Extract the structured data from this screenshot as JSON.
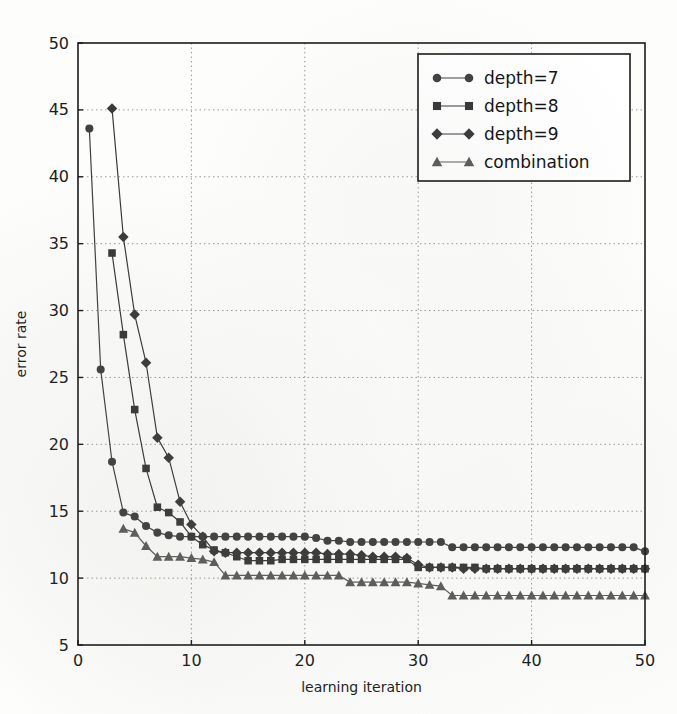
{
  "chart_data": {
    "type": "line",
    "title": "",
    "xlabel": "learning iteration",
    "ylabel": "error rate",
    "xlim": [
      0,
      50
    ],
    "ylim": [
      5,
      50
    ],
    "xticks": [
      0,
      10,
      20,
      30,
      40,
      50
    ],
    "yticks": [
      5,
      10,
      15,
      20,
      25,
      30,
      35,
      40,
      45,
      50
    ],
    "grid": true,
    "legend_position": "upper right",
    "series": [
      {
        "name": "depth=7",
        "marker": "circle",
        "color": "#404040",
        "x": [
          1,
          2,
          3,
          4,
          5,
          6,
          7,
          8,
          9,
          10,
          11,
          12,
          13,
          14,
          15,
          16,
          17,
          18,
          19,
          20,
          21,
          22,
          23,
          24,
          25,
          26,
          27,
          28,
          29,
          30,
          31,
          32,
          33,
          34,
          35,
          36,
          37,
          38,
          39,
          40,
          41,
          42,
          43,
          44,
          45,
          46,
          47,
          48,
          49,
          50
        ],
        "y": [
          43.6,
          25.6,
          18.7,
          14.9,
          14.6,
          13.9,
          13.4,
          13.2,
          13.1,
          13.1,
          13.1,
          13.1,
          13.1,
          13.1,
          13.1,
          13.1,
          13.1,
          13.1,
          13.1,
          13.1,
          13.0,
          12.8,
          12.8,
          12.7,
          12.7,
          12.7,
          12.7,
          12.7,
          12.7,
          12.7,
          12.7,
          12.7,
          12.3,
          12.3,
          12.3,
          12.3,
          12.3,
          12.3,
          12.3,
          12.3,
          12.3,
          12.3,
          12.3,
          12.3,
          12.3,
          12.3,
          12.3,
          12.3,
          12.3,
          12.0
        ]
      },
      {
        "name": "depth=8",
        "marker": "square",
        "color": "#383838",
        "x": [
          3,
          4,
          5,
          6,
          7,
          8,
          9,
          10,
          11,
          12,
          13,
          14,
          15,
          16,
          17,
          18,
          19,
          20,
          21,
          22,
          23,
          24,
          25,
          26,
          27,
          28,
          29,
          30,
          31,
          32,
          33,
          34,
          35,
          36,
          37,
          38,
          39,
          40,
          41,
          42,
          43,
          44,
          45,
          46,
          47,
          48,
          49,
          50
        ],
        "y": [
          34.3,
          28.2,
          22.6,
          18.2,
          15.3,
          14.9,
          14.2,
          13.1,
          12.5,
          12.1,
          11.9,
          11.6,
          11.3,
          11.3,
          11.3,
          11.4,
          11.4,
          11.4,
          11.4,
          11.4,
          11.4,
          11.4,
          11.4,
          11.4,
          11.4,
          11.4,
          11.4,
          10.8,
          10.8,
          10.8,
          10.8,
          10.8,
          10.8,
          10.7,
          10.7,
          10.7,
          10.7,
          10.7,
          10.7,
          10.7,
          10.7,
          10.7,
          10.7,
          10.7,
          10.7,
          10.7,
          10.7,
          10.7
        ]
      },
      {
        "name": "depth=9",
        "marker": "diamond",
        "color": "#3a3a3a",
        "x": [
          3,
          4,
          5,
          6,
          7,
          8,
          9,
          10,
          11,
          12,
          13,
          14,
          15,
          16,
          17,
          18,
          19,
          20,
          21,
          22,
          23,
          24,
          25,
          26,
          27,
          28,
          29,
          30,
          31,
          32,
          33,
          34,
          35,
          36,
          37,
          38,
          39,
          40,
          41,
          42,
          43,
          44,
          45,
          46,
          47,
          48,
          49,
          50
        ],
        "y": [
          45.1,
          35.5,
          29.7,
          26.1,
          20.5,
          19.0,
          15.7,
          14.0,
          13.1,
          12.0,
          11.9,
          11.9,
          11.9,
          11.9,
          11.9,
          11.9,
          11.9,
          11.9,
          11.9,
          11.8,
          11.8,
          11.8,
          11.7,
          11.6,
          11.6,
          11.6,
          11.5,
          11.0,
          10.8,
          10.8,
          10.8,
          10.7,
          10.7,
          10.7,
          10.7,
          10.7,
          10.7,
          10.7,
          10.7,
          10.7,
          10.7,
          10.7,
          10.7,
          10.7,
          10.7,
          10.7,
          10.7,
          10.7
        ]
      },
      {
        "name": "combination",
        "marker": "triangle",
        "color": "#5c5c5c",
        "x": [
          4,
          5,
          6,
          7,
          8,
          9,
          10,
          11,
          12,
          13,
          14,
          15,
          16,
          17,
          18,
          19,
          20,
          21,
          22,
          23,
          24,
          25,
          26,
          27,
          28,
          29,
          30,
          31,
          32,
          33,
          34,
          35,
          36,
          37,
          38,
          39,
          40,
          41,
          42,
          43,
          44,
          45,
          46,
          47,
          48,
          49,
          50
        ],
        "y": [
          13.7,
          13.4,
          12.4,
          11.6,
          11.6,
          11.6,
          11.5,
          11.4,
          11.2,
          10.2,
          10.2,
          10.2,
          10.2,
          10.2,
          10.2,
          10.2,
          10.2,
          10.2,
          10.2,
          10.2,
          9.7,
          9.7,
          9.7,
          9.7,
          9.7,
          9.7,
          9.6,
          9.5,
          9.4,
          8.7,
          8.7,
          8.7,
          8.7,
          8.7,
          8.7,
          8.7,
          8.7,
          8.7,
          8.7,
          8.7,
          8.7,
          8.7,
          8.7,
          8.7,
          8.7,
          8.7,
          8.7
        ]
      }
    ]
  },
  "legend": {
    "items": [
      {
        "label": "depth=7"
      },
      {
        "label": "depth=8"
      },
      {
        "label": "depth=9"
      },
      {
        "label": "combination"
      }
    ]
  },
  "axes": {
    "x_title": "learning iteration",
    "y_title": "error rate",
    "x_tick_labels": [
      "0",
      "10",
      "20",
      "30",
      "40",
      "50"
    ],
    "y_tick_labels": [
      "5",
      "10",
      "15",
      "20",
      "25",
      "30",
      "35",
      "40",
      "45",
      "50"
    ]
  },
  "colors": {
    "axis": "#1b1b1b",
    "grid": "#9a9a9a",
    "background": "#fdfdfc",
    "series_dark": "#404040",
    "series_light": "#5c5c5c"
  }
}
